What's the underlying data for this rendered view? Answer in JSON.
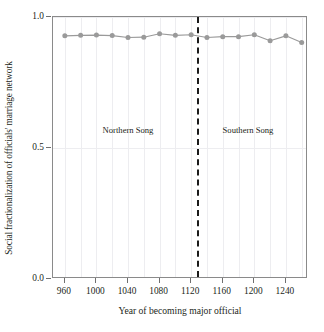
{
  "chart_data": {
    "type": "line",
    "title": "",
    "xlabel": "Year of  becoming major official",
    "ylabel": "Social fractionalization of officials' marriage network",
    "xlim": [
      945,
      1268
    ],
    "ylim": [
      0.0,
      1.0
    ],
    "grid": true,
    "legend": "none",
    "x": [
      960,
      980,
      1000,
      1020,
      1040,
      1060,
      1080,
      1100,
      1120,
      1140,
      1160,
      1180,
      1200,
      1220,
      1240,
      1260
    ],
    "values": [
      0.928,
      0.93,
      0.931,
      0.929,
      0.922,
      0.923,
      0.936,
      0.93,
      0.932,
      0.922,
      0.925,
      0.925,
      0.932,
      0.909,
      0.928,
      0.903
    ],
    "series": [
      {
        "name": "Social fractionalization",
        "values": [
          0.928,
          0.93,
          0.931,
          0.929,
          0.922,
          0.923,
          0.936,
          0.93,
          0.932,
          0.922,
          0.925,
          0.925,
          0.932,
          0.909,
          0.928,
          0.903
        ]
      }
    ],
    "xticks": [
      960,
      1000,
      1040,
      1080,
      1120,
      1160,
      1200,
      1240
    ],
    "xticklabels": [
      "960",
      "1000",
      "1040",
      "1080",
      "1120",
      "1160",
      "1200",
      "1240"
    ],
    "yticks": [
      0.0,
      0.5,
      1.0
    ],
    "yticklabels": [
      "0.0",
      "0.5",
      "1.0"
    ],
    "minor_xgrid": [
      960,
      980,
      1000,
      1020,
      1040,
      1060,
      1080,
      1100,
      1120,
      1140,
      1160,
      1180,
      1200,
      1220,
      1240,
      1260
    ],
    "annotations": [
      {
        "text": "Northern Song",
        "x": 1040,
        "y": 0.57
      },
      {
        "text": "Southern Song",
        "x": 1192,
        "y": 0.57
      }
    ],
    "vline": {
      "x": 1127,
      "style": "dashed",
      "color": "#1a1a1a"
    },
    "colors": {
      "series_line": "#9a9a9a",
      "series_marker": "#9a9a9a",
      "grid": "#ededf0",
      "frame": "#8a8a8a",
      "text": "#231f20",
      "vline": "#1a1a1a"
    }
  }
}
